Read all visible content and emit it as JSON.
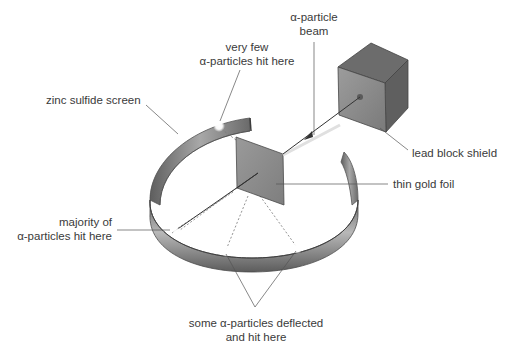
{
  "labels": {
    "beam": {
      "line1": "α-particle",
      "line2": "beam"
    },
    "very_few": {
      "line1": "very few",
      "line2": "α-particles hit here"
    },
    "screen": {
      "text": "zinc sulfide screen"
    },
    "lead_block": {
      "text": "lead block shield"
    },
    "gold_foil": {
      "text": "thin gold foil"
    },
    "majority": {
      "line1": "majority of",
      "line2": "α-particles hit here"
    },
    "deflected": {
      "line1": "some α-particles deflected",
      "line2": "and hit here"
    }
  },
  "components": [
    {
      "name": "lead block shield",
      "shape": "cube",
      "color": "#7a7a7a"
    },
    {
      "name": "thin gold foil",
      "shape": "square-plate",
      "color": "#8c8c8c"
    },
    {
      "name": "zinc sulfide screen",
      "shape": "open-ring",
      "color": "#8a8a8a"
    },
    {
      "name": "α-particle beam",
      "shape": "arrow"
    }
  ],
  "colors": {
    "text": "#3a3a3a",
    "leader": "#555555",
    "metal_dark": "#5a5a5a",
    "metal_mid": "#8a8a8a",
    "metal_light": "#cfcfcf",
    "hit_spot": "#ffffff"
  }
}
